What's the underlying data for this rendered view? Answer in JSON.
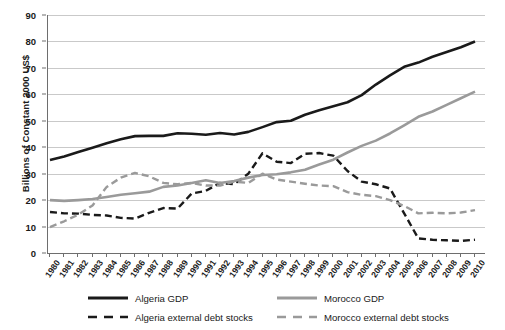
{
  "chart_data": {
    "type": "line",
    "title": "",
    "xlabel": "",
    "ylabel": "Billions of Constant 2000 US$",
    "ylim": [
      0,
      90
    ],
    "ytick_step": 10,
    "yticks": [
      0,
      10,
      20,
      30,
      40,
      50,
      60,
      70,
      80,
      90
    ],
    "grid": true,
    "legend_position": "bottom",
    "x": [
      1980,
      1981,
      1982,
      1983,
      1984,
      1985,
      1986,
      1987,
      1988,
      1989,
      1990,
      1991,
      1992,
      1993,
      1994,
      1995,
      1996,
      1997,
      1998,
      1999,
      2000,
      2001,
      2002,
      2003,
      2004,
      2005,
      2006,
      2007,
      2008,
      2009,
      2010
    ],
    "categories": [
      "1980",
      "1981",
      "1982",
      "1983",
      "1984",
      "1985",
      "1986",
      "1987",
      "1988",
      "1989",
      "1990",
      "1991",
      "1992",
      "1993",
      "1994",
      "1995",
      "1996",
      "1997",
      "1998",
      "1999",
      "2000",
      "2001",
      "2002",
      "2003",
      "2004",
      "2005",
      "2006",
      "2007",
      "2008",
      "2009",
      "2010"
    ],
    "series": [
      {
        "name": "Algeria GDP",
        "style": "solid",
        "color": "#1a1a1a",
        "width": 2.6,
        "values": [
          35.2,
          36.5,
          38.2,
          39.8,
          41.5,
          43.0,
          44.2,
          44.3,
          44.3,
          45.3,
          45.1,
          44.7,
          45.4,
          44.8,
          45.8,
          47.6,
          49.5,
          50.0,
          52.3,
          54.0,
          55.5,
          57.0,
          59.7,
          63.7,
          67.2,
          70.4,
          72.0,
          74.2,
          76.0,
          77.8,
          80.0
        ]
      },
      {
        "name": "Algeria external debt stocks",
        "style": "dashed",
        "color": "#1a1a1a",
        "width": 2.4,
        "values": [
          15.5,
          15.0,
          14.9,
          14.4,
          14.2,
          13.3,
          13.0,
          15.2,
          17.0,
          16.8,
          22.5,
          23.5,
          26.5,
          26.0,
          30.0,
          37.7,
          34.5,
          34.0,
          37.5,
          37.8,
          36.8,
          31.0,
          27.0,
          26.0,
          24.4,
          15.0,
          5.5,
          5.0,
          4.8,
          4.6,
          5.0
        ]
      },
      {
        "name": "Morocco GDP",
        "style": "solid",
        "color": "#9a9a9a",
        "width": 2.6,
        "values": [
          20.0,
          19.7,
          20.0,
          20.4,
          21.2,
          22.0,
          22.6,
          23.2,
          25.0,
          25.5,
          26.5,
          27.5,
          26.5,
          27.2,
          28.5,
          29.5,
          29.8,
          30.5,
          31.5,
          33.5,
          35.3,
          38.0,
          40.5,
          42.5,
          45.2,
          48.3,
          51.5,
          53.5,
          56.0,
          58.5,
          61.0
        ]
      },
      {
        "name": "Morocco external debt stocks",
        "style": "dashed",
        "color": "#9a9a9a",
        "width": 2.4,
        "values": [
          9.8,
          12.0,
          14.5,
          18.0,
          25.0,
          28.5,
          30.3,
          29.0,
          26.5,
          26.0,
          26.5,
          25.5,
          25.5,
          27.0,
          26.5,
          30.0,
          27.8,
          27.0,
          26.2,
          25.5,
          25.3,
          23.0,
          22.0,
          21.5,
          20.0,
          17.8,
          15.0,
          15.2,
          15.0,
          15.3,
          16.2
        ]
      }
    ]
  },
  "legend": {
    "entries": [
      {
        "label": "Algeria GDP",
        "style": "solid",
        "color": "#1a1a1a"
      },
      {
        "label": "Morocco GDP",
        "style": "solid",
        "color": "#9a9a9a"
      },
      {
        "label": "Algeria external debt stocks",
        "style": "dashed",
        "color": "#1a1a1a"
      },
      {
        "label": "Morocco external debt stocks",
        "style": "dashed",
        "color": "#9a9a9a"
      }
    ]
  },
  "colors": {
    "algeria": "#1a1a1a",
    "morocco": "#9a9a9a",
    "grid": "#c9c9c9",
    "axis": "#6e6e6e",
    "background": "#ffffff"
  }
}
